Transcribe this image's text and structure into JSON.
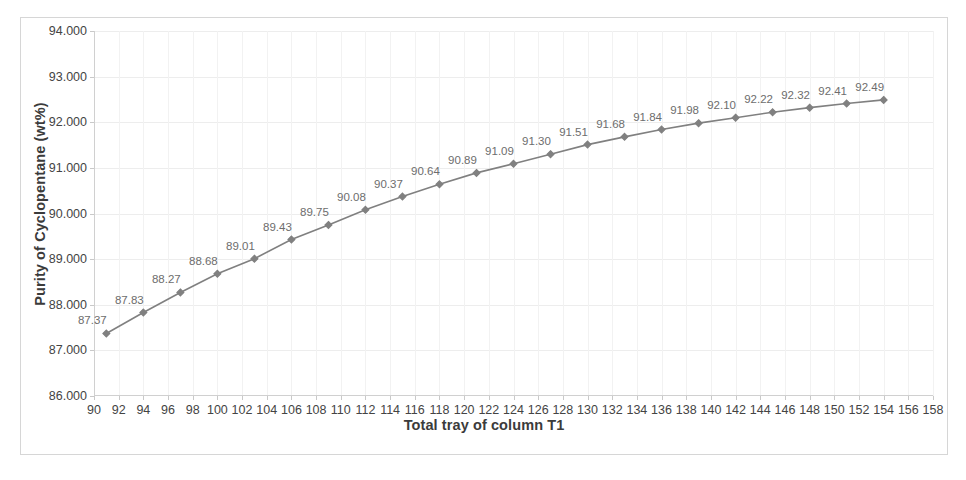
{
  "chart_data": {
    "type": "line",
    "title": "",
    "xlabel": "Total tray of column T1",
    "ylabel": "Purity of Cyclopentane (wt%)",
    "xlim": [
      90,
      158
    ],
    "ylim": [
      86.0,
      94.0
    ],
    "xticks": [
      90,
      92,
      94,
      96,
      98,
      100,
      102,
      104,
      106,
      108,
      110,
      112,
      114,
      116,
      118,
      120,
      122,
      124,
      126,
      128,
      130,
      132,
      134,
      136,
      138,
      140,
      142,
      144,
      146,
      148,
      150,
      152,
      154,
      156,
      158
    ],
    "ytick_labels": [
      "86.000",
      "87.000",
      "88.000",
      "89.000",
      "90.000",
      "91.000",
      "92.000",
      "93.000",
      "94.000"
    ],
    "yticks": [
      86,
      87,
      88,
      89,
      90,
      91,
      92,
      93,
      94
    ],
    "grid": true,
    "legend": "none",
    "marker": "diamond",
    "series_color": "#808080",
    "label_color": "#6d6d6d",
    "x": [
      91,
      94,
      97,
      100,
      103,
      106,
      109,
      112,
      115,
      118,
      121,
      124,
      127,
      130,
      133,
      136,
      139,
      142,
      145,
      148,
      151,
      154
    ],
    "values": [
      87.37,
      87.83,
      88.27,
      88.68,
      89.01,
      89.43,
      89.75,
      90.08,
      90.37,
      90.64,
      90.89,
      91.09,
      91.3,
      91.51,
      91.68,
      91.84,
      91.98,
      92.1,
      92.22,
      92.32,
      92.41,
      92.49
    ],
    "point_labels": [
      "87.37",
      "87.83",
      "88.27",
      "88.68",
      "89.01",
      "89.43",
      "89.75",
      "90.08",
      "90.37",
      "90.64",
      "90.89",
      "91.09",
      "91.30",
      "91.51",
      "91.68",
      "91.84",
      "91.98",
      "92.10",
      "92.22",
      "92.32",
      "92.41",
      "92.49"
    ]
  }
}
